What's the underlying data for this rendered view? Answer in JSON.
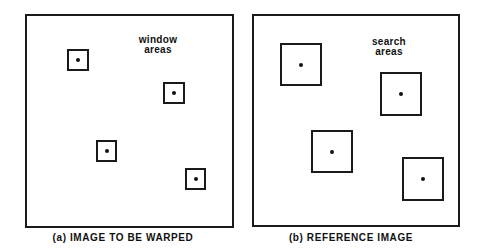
{
  "figure": {
    "panels": [
      {
        "id": "a",
        "label_line1": "window",
        "label_line2": "areas",
        "caption": "(a) IMAGE TO BE WARPED"
      },
      {
        "id": "b",
        "label_line1": "search",
        "label_line2": "areas",
        "caption": "(b) REFERENCE IMAGE"
      }
    ]
  }
}
